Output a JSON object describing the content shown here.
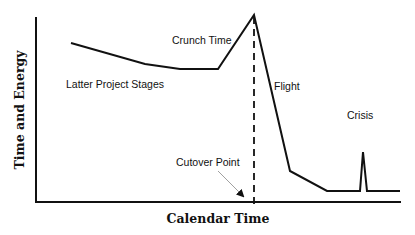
{
  "chart_data": {
    "type": "line",
    "title": "",
    "xlabel": "Calendar Time",
    "ylabel": "Time and Energy",
    "grid": false,
    "legend": null,
    "points_px": [
      [
        71,
        43
      ],
      [
        145,
        64
      ],
      [
        180,
        69
      ],
      [
        218,
        69
      ],
      [
        254,
        15
      ],
      [
        290,
        171
      ],
      [
        327,
        191
      ],
      [
        360,
        191
      ],
      [
        363,
        152
      ],
      [
        367,
        191
      ],
      [
        400,
        191
      ]
    ],
    "series": [
      {
        "name": "Time and Energy",
        "description": "Effort declines through latter project stages, rises sharply at crunch time to a peak at the cutover point, drops during flight, then stays low except for a brief crisis spike",
        "x": [
          0.1,
          0.3,
          0.4,
          0.5,
          0.6,
          0.7,
          0.8,
          0.89,
          0.9,
          0.91,
          1.0
        ],
        "values": [
          0.86,
          0.74,
          0.72,
          0.72,
          1.0,
          0.17,
          0.06,
          0.06,
          0.27,
          0.06,
          0.06
        ]
      }
    ],
    "annotations": [
      {
        "text": "Latter Project Stages",
        "x": 66,
        "y": 88
      },
      {
        "text": "Crunch Time",
        "x": 172,
        "y": 44
      },
      {
        "text": "Flight",
        "x": 274,
        "y": 89
      },
      {
        "text": "Crisis",
        "x": 347,
        "y": 118
      },
      {
        "text": "Cutover Point",
        "x": 176,
        "y": 165
      }
    ],
    "cutover_line": {
      "x": 254,
      "style": "dashed"
    }
  },
  "labels": {
    "latter": "Latter Project Stages",
    "crunch": "Crunch Time",
    "flight": "Flight",
    "crisis": "Crisis",
    "cutover": "Cutover Point",
    "xaxis": "Calendar Time",
    "yaxis": "Time and Energy"
  }
}
